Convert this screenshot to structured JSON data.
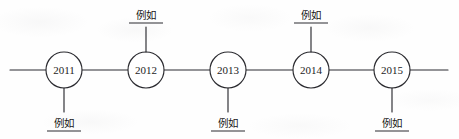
{
  "figure": {
    "kind": "horizontal-timeline",
    "width": 459,
    "height": 139,
    "background_color": "#fefefe",
    "stroke_color": "#2b2b30",
    "text_color": "#1d1d1d"
  },
  "axis": {
    "label": "timeline-axis",
    "y": 70,
    "start_x": 10,
    "end_x": 448
  },
  "nodes": [
    {
      "id": "node-2011",
      "year": "2011",
      "cx": 64,
      "cy": 70,
      "r": 18,
      "callout": {
        "text": "例如",
        "side": "below",
        "stem_from_y": 88,
        "stem_to_y": 112,
        "text_y": 127,
        "underline_y": 131,
        "underline_half_width": 17
      }
    },
    {
      "id": "node-2012",
      "year": "2012",
      "cx": 146,
      "cy": 70,
      "r": 18,
      "callout": {
        "text": "例如",
        "side": "above",
        "stem_from_y": 52,
        "stem_to_y": 27,
        "text_y": 19,
        "underline_y": 23,
        "underline_half_width": 17
      }
    },
    {
      "id": "node-2013",
      "year": "2013",
      "cx": 228,
      "cy": 70,
      "r": 18,
      "callout": {
        "text": "例如",
        "side": "below",
        "stem_from_y": 88,
        "stem_to_y": 112,
        "text_y": 127,
        "underline_y": 131,
        "underline_half_width": 17
      }
    },
    {
      "id": "node-2014",
      "year": "2014",
      "cx": 311,
      "cy": 70,
      "r": 18,
      "callout": {
        "text": "例如",
        "side": "above",
        "stem_from_y": 52,
        "stem_to_y": 27,
        "text_y": 19,
        "underline_y": 23,
        "underline_half_width": 17
      }
    },
    {
      "id": "node-2015",
      "year": "2015",
      "cx": 392,
      "cy": 70,
      "r": 18,
      "callout": {
        "text": "例如",
        "side": "below",
        "stem_from_y": 88,
        "stem_to_y": 112,
        "text_y": 127,
        "underline_y": 131,
        "underline_half_width": 17
      }
    }
  ]
}
